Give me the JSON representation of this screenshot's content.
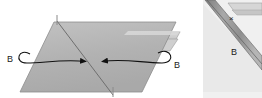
{
  "figure": {
    "width": 262,
    "height": 98,
    "background_color": "#ffffff",
    "panels": [
      {
        "id": "main-panel",
        "name": "main-fold-panel",
        "x": 0,
        "y": 0,
        "width": 196,
        "height": 98,
        "background_color": "#ffffff"
      },
      {
        "id": "detail-panel",
        "name": "detail-inset-panel",
        "x": 203,
        "y": 0,
        "width": 59,
        "height": 98,
        "background_color": "#f2f2f2"
      }
    ]
  },
  "colors": {
    "sheet_fill": "#b4b4b4",
    "sheet_fill_light": "#c8c8c8",
    "flap_fill": "#d2d2d2",
    "flap_fill_dark": "#a8a8a8",
    "edge_stroke": "#8a8a8a",
    "crease_stroke": "#7a7a7a",
    "arrow_stroke": "#111111",
    "label_color": "#1a1a1a",
    "detail_band": "#9a9a9a",
    "detail_band_edge": "#707070",
    "detail_background": "#f0f0f0",
    "detail_face": "#e8e8e8"
  },
  "main_panel": {
    "name": "main-fold-panel",
    "sheet": {
      "name": "parallelogram-sheet",
      "points": "54,22 175,22 142,92 20,92",
      "fill": "#b4b4b4"
    },
    "crease": {
      "name": "diagonal-crease-line",
      "from": {
        "x": 57,
        "y": 21
      },
      "to": {
        "x": 113,
        "y": 95
      }
    },
    "upper_flap": {
      "name": "upper-right-flap",
      "points": "132,33 178,33 172,44 126,44"
    },
    "lower_flap": {
      "name": "lower-right-flap",
      "points": "128,40 176,40 168,52 122,52"
    },
    "tick_top": {
      "name": "top-crease-tick",
      "from": {
        "x": 57,
        "y": 16
      },
      "to": {
        "x": 57,
        "y": 24
      }
    },
    "tick_bottom": {
      "name": "bottom-crease-tick",
      "from": {
        "x": 113,
        "y": 88
      },
      "to": {
        "x": 113,
        "y": 96
      }
    },
    "arrows": [
      {
        "name": "left-fold-arrow",
        "path": "M 28 56 C 18 48, 14 62, 26 62 C 40 62, 60 60, 88 62",
        "arrowhead": {
          "x": 88,
          "y": 62,
          "direction": "right"
        },
        "label": "B",
        "label_x": 7,
        "label_y": 60
      },
      {
        "name": "right-fold-arrow",
        "path": "M 160 54 C 172 46, 176 62, 163 62 C 140 62, 122 58, 100 62",
        "arrowhead": {
          "x": 100,
          "y": 62,
          "direction": "left"
        },
        "label": "B",
        "label_x": 175,
        "label_y": 66
      }
    ],
    "labels": [
      {
        "name": "label-b-left",
        "text": "B",
        "x": 7,
        "y": 60
      },
      {
        "name": "label-b-right",
        "text": "B",
        "x": 175,
        "y": 66
      }
    ]
  },
  "detail_panel": {
    "name": "detail-inset-panel",
    "band": {
      "name": "diagonal-folded-band",
      "points": "206,0 216,0 262,58 262,72"
    },
    "top_flap": {
      "name": "detail-top-flap",
      "points": "230,4 262,4 262,12 236,12"
    },
    "cross_mark": {
      "name": "cross-mark-x",
      "text": "×",
      "x": 233,
      "y": 18
    },
    "label": {
      "name": "label-b-detail",
      "text": "B",
      "x": 234,
      "y": 52
    },
    "labels": [
      {
        "name": "label-b-detail",
        "text": "B",
        "x": 234,
        "y": 52
      },
      {
        "name": "cross-mark-x",
        "text": "×",
        "x": 233,
        "y": 18
      }
    ]
  },
  "text_items": {
    "b_left": "B",
    "b_right": "B",
    "b_detail": "B",
    "cross": "×"
  }
}
